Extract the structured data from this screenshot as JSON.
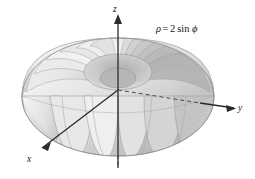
{
  "figure": {
    "title": "",
    "background_color": "#ffffff",
    "equation": {
      "rho_symbol": "ρ",
      "equals": "=",
      "coefficient": "2",
      "function": "sin",
      "phi_symbol": "ϕ",
      "full_text": "ρ = 2 sin ϕ"
    },
    "axes": [
      {
        "id": "z",
        "label": "z",
        "direction": "up",
        "label_x": 113,
        "label_y": 5,
        "arrow_x": 118,
        "arrow_y": 18
      },
      {
        "id": "y",
        "label": "y",
        "direction": "right",
        "label_x": 238,
        "label_y": 104,
        "arrow_x": 232,
        "arrow_y": 108
      },
      {
        "id": "x",
        "label": "x",
        "direction": "down-left",
        "label_x": 27,
        "label_y": 155,
        "arrow_x": 40,
        "arrow_y": 150
      }
    ],
    "origin": {
      "x": 118,
      "y": 90
    },
    "surface": {
      "type": "torus",
      "equation": "rho = 2 sin phi",
      "center_x": 118,
      "center_y": 95,
      "radius_x": 96,
      "radius_y": 42,
      "segments": 20,
      "fill_light": "#f2f2f2",
      "fill_mid": "#cfcfcf",
      "fill_dark": "#9d9d9d",
      "stroke": "#8a8a8a"
    },
    "colors": {
      "background": "#ffffff",
      "axis": "#2b2b2b",
      "axis_dashed": "#4a4a4a",
      "surface_light": "#f4f4f4",
      "surface_mid": "#cccccc",
      "surface_dark": "#9a9a9a",
      "text": "#161616"
    }
  }
}
